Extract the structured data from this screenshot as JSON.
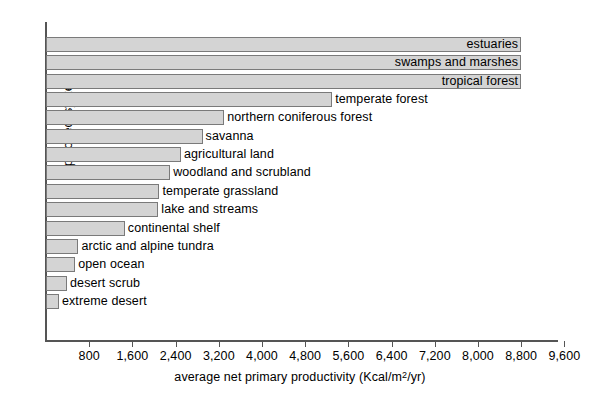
{
  "chart_data": {
    "type": "bar",
    "orientation": "horizontal",
    "title": "",
    "xlabel": "average net primary productivity (Kcal/m2/yr)",
    "xlabel_parts": {
      "prefix": "average net primary productivity (Kcal/m",
      "superscript": "2",
      "suffix": "/yr)"
    },
    "ylabel": "type of ecosystem",
    "xlim": [
      0,
      10000
    ],
    "xticks": [
      800,
      1600,
      2400,
      3200,
      4000,
      4800,
      5600,
      6400,
      7200,
      8000,
      8800,
      9600
    ],
    "xtick_labels": [
      "800",
      "1,600",
      "2,400",
      "3,200",
      "4,000",
      "4,800",
      "5,600",
      "6,400",
      "7,200",
      "8,000",
      "8,800",
      "9,600"
    ],
    "grid": false,
    "legend": "none",
    "bar_color": "#d4d4d4",
    "bar_edge_color": "#7a7a7a",
    "categories": [
      "estuaries",
      "swamps and marshes",
      "tropical forest",
      "temperate forest",
      "northern coniferous forest",
      "savanna",
      "agricultural land",
      "woodland and scrubland",
      "temperate grassland",
      "lake and streams",
      "continental shelf",
      "arctic and alpine tundra",
      "open ocean",
      "desert scrub",
      "extreme desert"
    ],
    "values": [
      8800,
      8800,
      8800,
      5300,
      3300,
      2900,
      2500,
      2300,
      2100,
      2100,
      1460,
      600,
      540,
      390,
      240
    ],
    "bars": [
      {
        "label": "estuaries",
        "value": 8800,
        "label_position": "inside"
      },
      {
        "label": "swamps and marshes",
        "value": 8800,
        "label_position": "inside"
      },
      {
        "label": "tropical forest",
        "value": 8800,
        "label_position": "inside"
      },
      {
        "label": "temperate forest",
        "value": 5300,
        "label_position": "outside"
      },
      {
        "label": "northern coniferous forest",
        "value": 3300,
        "label_position": "outside"
      },
      {
        "label": "savanna",
        "value": 2900,
        "label_position": "outside"
      },
      {
        "label": "agricultural land",
        "value": 2500,
        "label_position": "outside"
      },
      {
        "label": "woodland and scrubland",
        "value": 2300,
        "label_position": "outside"
      },
      {
        "label": "temperate grassland",
        "value": 2100,
        "label_position": "outside"
      },
      {
        "label": "lake and streams",
        "value": 2080,
        "label_position": "outside"
      },
      {
        "label": "continental shelf",
        "value": 1460,
        "label_position": "outside"
      },
      {
        "label": "arctic and alpine tundra",
        "value": 600,
        "label_position": "outside"
      },
      {
        "label": "open ocean",
        "value": 540,
        "label_position": "outside"
      },
      {
        "label": "desert scrub",
        "value": 390,
        "label_position": "outside"
      },
      {
        "label": "extreme desert",
        "value": 240,
        "label_position": "outside"
      }
    ]
  }
}
